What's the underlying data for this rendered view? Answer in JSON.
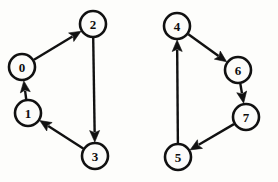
{
  "figure": {
    "type": "directed-graph-diagram",
    "background_color": "#fdfdfb",
    "ink_color": "#111111",
    "width": 278,
    "height": 182,
    "components": 2
  },
  "nodes": [
    {
      "id": "0",
      "label": "0",
      "cx": 22,
      "cy": 67,
      "r": 13
    },
    {
      "id": "1",
      "label": "1",
      "cx": 28,
      "cy": 113,
      "r": 13
    },
    {
      "id": "2",
      "label": "2",
      "cx": 93,
      "cy": 24,
      "r": 13
    },
    {
      "id": "3",
      "label": "3",
      "cx": 95,
      "cy": 156,
      "r": 13
    },
    {
      "id": "4",
      "label": "4",
      "cx": 177,
      "cy": 26,
      "r": 13
    },
    {
      "id": "5",
      "label": "5",
      "cx": 178,
      "cy": 157,
      "r": 13
    },
    {
      "id": "6",
      "label": "6",
      "cx": 238,
      "cy": 70,
      "r": 13
    },
    {
      "id": "7",
      "label": "7",
      "cx": 246,
      "cy": 117,
      "r": 13
    }
  ],
  "edges": [
    {
      "id": "e-0-2",
      "from": "0",
      "to": "2",
      "directed": true
    },
    {
      "id": "e-2-3",
      "from": "2",
      "to": "3",
      "directed": true
    },
    {
      "id": "e-3-1",
      "from": "3",
      "to": "1",
      "directed": true
    },
    {
      "id": "e-1-0",
      "from": "1",
      "to": "0",
      "directed": true
    },
    {
      "id": "e-4-6",
      "from": "4",
      "to": "6",
      "directed": true
    },
    {
      "id": "e-6-7",
      "from": "6",
      "to": "7",
      "directed": true
    },
    {
      "id": "e-7-5",
      "from": "7",
      "to": "5",
      "directed": true
    },
    {
      "id": "e-5-4",
      "from": "5",
      "to": "4",
      "directed": true
    }
  ]
}
